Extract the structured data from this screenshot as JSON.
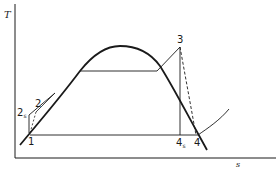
{
  "diagram": {
    "type": "T-s diagram (Rankine cycle with irreversible pump and turbine)",
    "axes": {
      "y_label": "T",
      "x_label": "s"
    },
    "points": [
      {
        "id": "1",
        "label": "1"
      },
      {
        "id": "2",
        "label": "2"
      },
      {
        "id": "2s",
        "label": "2",
        "subscript": "s"
      },
      {
        "id": "3",
        "label": "3"
      },
      {
        "id": "4",
        "label": "4"
      },
      {
        "id": "4s",
        "label": "4",
        "subscript": "s"
      }
    ],
    "colors": {
      "line": "#1a1a1a",
      "background": "#ffffff"
    }
  }
}
